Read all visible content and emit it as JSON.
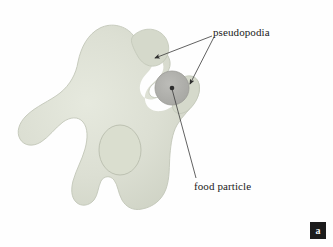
{
  "figure": {
    "panel_label": "a",
    "background_color": "#fefefe"
  },
  "labels": {
    "pseudopodia": "pseudopodia",
    "food_particle": "food particle"
  },
  "colors": {
    "cell_body": "#dcdfd3",
    "cell_body_shade": "#cfd3c5",
    "cell_outline": "#c2c6b8",
    "nucleus_fill": "#dcdfd3",
    "nucleus_outline": "#b9bdae",
    "vacuole_fill": "#fefefe",
    "food_particle": "#b2b2ae",
    "food_particle_outline": "#9a9a96",
    "leader_line": "#3a3a3a",
    "text": "#1a1a1a",
    "badge_background": "#1b1b1b",
    "badge_text": "#f2f2f2"
  },
  "structures": [
    {
      "name": "pseudopodia",
      "count": 2,
      "description": "arm-like extensions surrounding the food particle"
    },
    {
      "name": "food particle",
      "count": 1,
      "description": "dark round particle being engulfed in a food vacuole"
    },
    {
      "name": "nucleus",
      "count": 1,
      "description": "oval nucleus in the central cytoplasm"
    }
  ]
}
